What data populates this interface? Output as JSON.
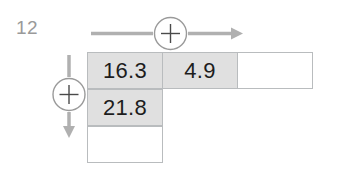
{
  "page": {
    "corner_label": "12",
    "background_color": "#ffffff"
  },
  "operators": {
    "column_operator": {
      "icon": "plus-in-circle-icon",
      "symbol": "+",
      "direction": "right",
      "color": "#b0b0b0"
    },
    "row_operator": {
      "icon": "plus-in-circle-icon",
      "symbol": "+",
      "direction": "down",
      "color": "#b0b0b0"
    }
  },
  "grid": {
    "rows": [
      {
        "cells": [
          {
            "value": "16.3",
            "state": "filled"
          },
          {
            "value": "4.9",
            "state": "filled"
          },
          {
            "value": "",
            "state": "empty"
          }
        ]
      },
      {
        "cells": [
          {
            "value": "21.8",
            "state": "filled"
          },
          {
            "value": "",
            "state": "hidden"
          },
          {
            "value": "",
            "state": "hidden"
          }
        ]
      },
      {
        "cells": [
          {
            "value": "",
            "state": "empty"
          },
          {
            "value": "",
            "state": "hidden"
          },
          {
            "value": "",
            "state": "hidden"
          }
        ]
      }
    ],
    "filled_color": "#e0e0e0",
    "empty_color": "#ffffff",
    "border_color": "#b9bcbe",
    "text_color": "#1d1d1d"
  }
}
